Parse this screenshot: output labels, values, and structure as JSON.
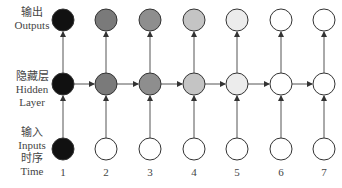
{
  "row_labels": {
    "outputs": {
      "zh": "输出",
      "en": "Outputs"
    },
    "hidden": {
      "zh": "隐藏层",
      "en1": "Hidden",
      "en2": "Layer"
    },
    "inputs": {
      "zh": "输入",
      "en": "Inputs",
      "zh2": "时序",
      "en2": "Time"
    }
  },
  "time_steps": [
    "1",
    "2",
    "3",
    "4",
    "5",
    "6",
    "7"
  ],
  "columns_x": [
    63,
    106,
    150,
    194,
    237,
    281,
    324
  ],
  "rows_y": {
    "output": 20,
    "hidden": 84,
    "input": 149
  },
  "radius": 11,
  "colors": {
    "output": [
      "#111111",
      "#7a7a7a",
      "#8e8e8e",
      "#c4c4c4",
      "#ececec",
      "#ffffff",
      "#ffffff"
    ],
    "hidden": [
      "#111111",
      "#7a7a7a",
      "#8e8e8e",
      "#c4c4c4",
      "#ececec",
      "#ffffff",
      "#ffffff"
    ],
    "input": [
      "#111111",
      "#ffffff",
      "#ffffff",
      "#ffffff",
      "#ffffff",
      "#ffffff",
      "#ffffff"
    ],
    "stroke": "#333333"
  }
}
